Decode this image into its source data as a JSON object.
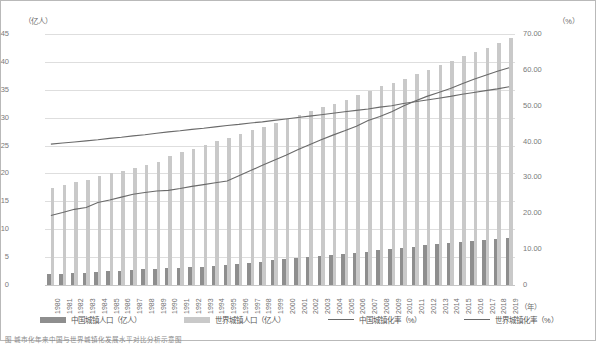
{
  "axes": {
    "left_unit": "（亿人）",
    "right_unit": "（%）",
    "x_unit": "（年）",
    "left_ticks": [
      "45",
      "40",
      "35",
      "30",
      "25",
      "20",
      "15",
      "10",
      "5",
      "0"
    ],
    "right_ticks": [
      "70.00",
      "60.00",
      "50.00",
      "40.00",
      "30.00",
      "20.00",
      "10.00",
      "0"
    ]
  },
  "legend": {
    "items": [
      {
        "label": "中国城镇人口（亿人）",
        "marker": "bar",
        "color": "#8e8e8e"
      },
      {
        "label": "世界城镇人口（亿人）",
        "marker": "bar",
        "color": "#c9c9c9"
      },
      {
        "label": "中国城镇化率（%）",
        "marker": "line",
        "color": "#6a6a6a"
      },
      {
        "label": "世界城镇化率（%）",
        "marker": "line",
        "color": "#6a6a6a"
      }
    ]
  },
  "chart_data": {
    "type": "bar",
    "title": "",
    "subtitle": "",
    "xlabel": "（年）",
    "ylabel": "（亿人）",
    "y2label": "（%）",
    "ylim": [
      0,
      45
    ],
    "y2lim": [
      0,
      70
    ],
    "grid": true,
    "legend_position": "bottom",
    "categories": [
      "1980",
      "1981",
      "1982",
      "1983",
      "1984",
      "1985",
      "1986",
      "1987",
      "1988",
      "1989",
      "1990",
      "1991",
      "1992",
      "1993",
      "1994",
      "1995",
      "1996",
      "1997",
      "1998",
      "1999",
      "2000",
      "2001",
      "2002",
      "2003",
      "2004",
      "2005",
      "2006",
      "2007",
      "2008",
      "2009",
      "2010",
      "2011",
      "2012",
      "2013",
      "2014",
      "2015",
      "2016",
      "2017",
      "2018",
      "2019"
    ],
    "series": [
      {
        "name": "中国城镇人口（亿人）",
        "type": "bar",
        "axis": "left",
        "color": "#8e8e8e",
        "values": [
          1.9,
          1.9,
          2.1,
          2.2,
          2.4,
          2.5,
          2.6,
          2.7,
          2.8,
          2.9,
          3.0,
          3.1,
          3.2,
          3.3,
          3.4,
          3.5,
          3.7,
          3.9,
          4.2,
          4.4,
          4.6,
          4.8,
          5.0,
          5.2,
          5.4,
          5.6,
          5.8,
          6.0,
          6.2,
          6.4,
          6.7,
          6.9,
          7.1,
          7.3,
          7.5,
          7.7,
          7.9,
          8.1,
          8.3,
          8.5
        ]
      },
      {
        "name": "世界城镇人口（亿人）",
        "type": "bar",
        "axis": "left",
        "color": "#c9c9c9",
        "values": [
          17.4,
          18.0,
          18.5,
          18.9,
          19.5,
          20.0,
          20.5,
          21.0,
          21.5,
          22.0,
          23.1,
          23.9,
          24.4,
          25.1,
          25.8,
          26.4,
          27.1,
          27.8,
          28.4,
          29.0,
          29.8,
          30.5,
          31.2,
          31.9,
          32.5,
          33.2,
          34.0,
          34.8,
          35.6,
          36.2,
          37.0,
          37.8,
          38.6,
          39.5,
          40.2,
          41.0,
          41.7,
          42.5,
          43.3,
          44.2
        ]
      },
      {
        "name": "中国城镇化率（%）",
        "type": "line",
        "axis": "right",
        "color": "#6a6a6a",
        "values": [
          19.4,
          20.2,
          21.1,
          21.6,
          23.0,
          23.7,
          24.5,
          25.3,
          25.8,
          26.2,
          26.4,
          26.9,
          27.5,
          28.0,
          28.5,
          29.0,
          30.5,
          31.9,
          33.4,
          34.8,
          36.2,
          37.7,
          39.1,
          40.5,
          41.8,
          43.0,
          44.3,
          45.9,
          47.0,
          48.3,
          49.9,
          51.3,
          52.6,
          53.7,
          54.8,
          56.1,
          57.4,
          58.5,
          59.6,
          60.6
        ]
      },
      {
        "name": "世界城镇化率（%）",
        "type": "line",
        "axis": "right",
        "color": "#6a6a6a",
        "values": [
          39.3,
          39.6,
          39.9,
          40.2,
          40.5,
          40.9,
          41.2,
          41.6,
          41.9,
          42.3,
          42.7,
          43.0,
          43.4,
          43.7,
          44.1,
          44.5,
          44.8,
          45.2,
          45.5,
          45.9,
          46.3,
          46.7,
          47.1,
          47.5,
          47.9,
          48.3,
          48.7,
          49.1,
          49.6,
          50.0,
          50.6,
          51.1,
          51.6,
          52.1,
          52.6,
          53.2,
          53.7,
          54.2,
          54.7,
          55.3
        ]
      }
    ]
  },
  "caption": "图  城市化年来中国与世界城镇化发展水平对比分析示意图"
}
